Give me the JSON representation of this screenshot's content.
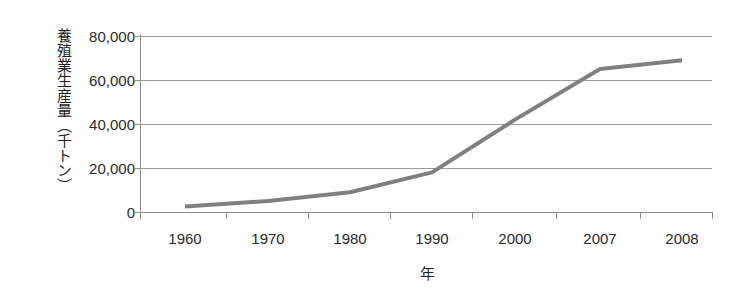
{
  "chart_data": {
    "type": "line",
    "title": "",
    "xlabel": "年",
    "ylabel": "養殖業生産量（千トン）",
    "categories": [
      "1960",
      "1970",
      "1980",
      "1990",
      "2000",
      "2007",
      "2008"
    ],
    "values": [
      2500,
      5000,
      9000,
      18000,
      42000,
      65000,
      69000
    ],
    "series": [
      {
        "name": "養殖業生産量",
        "values": [
          2500,
          5000,
          9000,
          18000,
          42000,
          65000,
          69000
        ],
        "color": "#808080"
      }
    ],
    "ylim": [
      0,
      80000
    ],
    "ytick_values": [
      0,
      20000,
      40000,
      60000,
      80000
    ],
    "ytick_labels": [
      "0",
      "20,000",
      "40,000",
      "60,000",
      "80,000"
    ],
    "xtick_labels": [
      "1960",
      "1970",
      "1980",
      "1990",
      "2000",
      "2007",
      "2008"
    ],
    "grid": "horizontal",
    "legend": "none",
    "background_color": "#ffffff",
    "axis_color": "#8c8c8c",
    "gridline_color": "#9a9a9a",
    "line_color": "#808080",
    "line_width": 4
  }
}
